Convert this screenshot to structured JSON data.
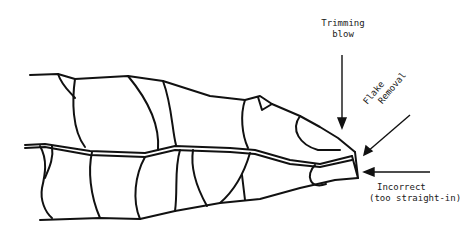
{
  "diagram": {
    "labels": {
      "trimming_blow_line1": "Trimming",
      "trimming_blow_line2": "blow",
      "flake_removal_line1": "Flake",
      "flake_removal_line2": "Removal",
      "incorrect_line1": "Incorrect",
      "incorrect_line2": "(too straight-in)"
    },
    "arrows": [
      {
        "name": "trimming-blow-arrow",
        "direction": "down"
      },
      {
        "name": "flake-removal-arrow",
        "direction": "down-left"
      },
      {
        "name": "incorrect-arrow",
        "direction": "left"
      }
    ],
    "stroke_color": "#111111",
    "background_color": "#ffffff"
  }
}
